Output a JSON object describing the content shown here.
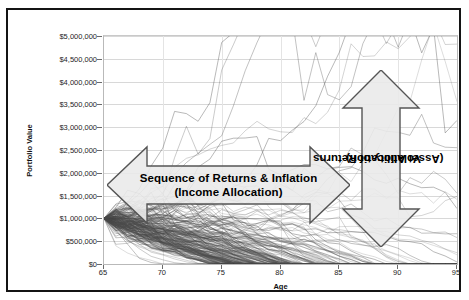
{
  "top_sliver": "",
  "chart_data": {
    "type": "line",
    "title": "",
    "subtitle": "",
    "xlabel": "Age",
    "ylabel": "Portfolio Value",
    "xlim": [
      65,
      95
    ],
    "ylim": [
      0,
      5000000
    ],
    "xticks": [
      65,
      70,
      75,
      80,
      85,
      90,
      95
    ],
    "xtick_labels": [
      "65",
      "70",
      "75",
      "80",
      "85",
      "90",
      "95"
    ],
    "yticks": [
      0,
      500000,
      1000000,
      1500000,
      2000000,
      2500000,
      3000000,
      3500000,
      4000000,
      4500000,
      5000000
    ],
    "ytick_labels": [
      "$0",
      "$500,000",
      "$1,000,000",
      "$1,500,000",
      "$2,000,000",
      "$2,500,000",
      "$3,000,000",
      "$3,500,000",
      "$4,000,000",
      "$4,500,000",
      "$5,000,000"
    ],
    "grid": true,
    "legend": null,
    "series_start_value": 1000000,
    "series_count": 200,
    "line_color": "#4a4a4a",
    "annotations": [
      {
        "id": "horizontal-arrow",
        "shape": "double-headed-horizontal-arrow",
        "lines": [
          "Sequence of Returns & Inflation",
          "(Income Allocation)"
        ],
        "x_range": [
          65.5,
          86
        ],
        "y_center": 1400000,
        "fill": "#e9e9e9",
        "stroke": "#555555"
      },
      {
        "id": "vertical-arrow",
        "shape": "double-headed-vertical-arrow",
        "lines": [
          "Volatility of Returns",
          "(Asset Allocation)"
        ],
        "x_center": 88.5,
        "y_range": [
          400000,
          4250000
        ],
        "fill": "#e9e9e9",
        "stroke": "#555555"
      }
    ]
  },
  "colors": {
    "frame": "#141414",
    "grid": "#d8d8d8",
    "plot_border": "#b9b9b9",
    "annotation_fill": "#e9e9e9",
    "annotation_stroke": "#555555",
    "text": "#111111"
  }
}
